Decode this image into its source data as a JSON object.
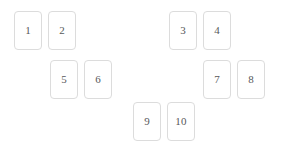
{
  "board": {
    "name": "card-grid",
    "background_color": "#ffffff",
    "card_style": {
      "width": 28,
      "height": 39,
      "border_color": "#dcdcdc",
      "background_color": "#ffffff",
      "text_color": "#57585a",
      "border_radius": 4
    },
    "cards": [
      {
        "label": "1",
        "x": 14,
        "y": 11
      },
      {
        "label": "2",
        "x": 48,
        "y": 11
      },
      {
        "label": "3",
        "x": 169,
        "y": 11
      },
      {
        "label": "4",
        "x": 203,
        "y": 11
      },
      {
        "label": "5",
        "x": 50,
        "y": 60
      },
      {
        "label": "6",
        "x": 84,
        "y": 60
      },
      {
        "label": "7",
        "x": 203,
        "y": 60
      },
      {
        "label": "8",
        "x": 237,
        "y": 60
      },
      {
        "label": "9",
        "x": 133,
        "y": 102
      },
      {
        "label": "10",
        "x": 167,
        "y": 102
      }
    ]
  }
}
